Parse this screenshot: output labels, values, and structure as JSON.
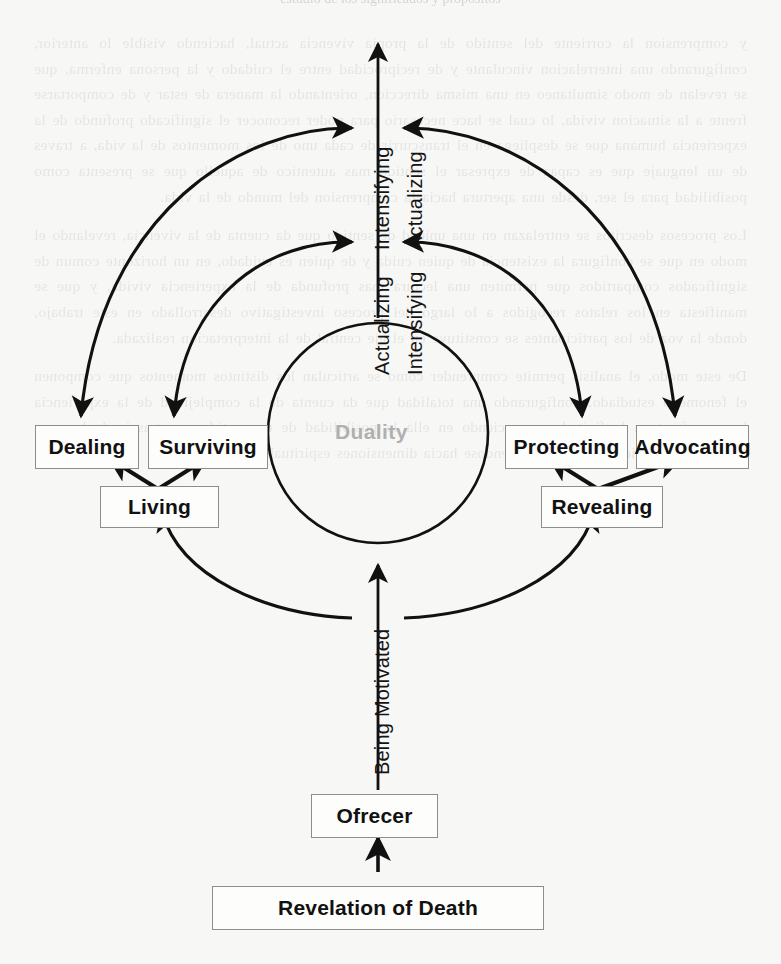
{
  "page": {
    "background_color": "#f7f7f5",
    "ink_color": "#111111",
    "box_border_color": "#8d8d8d",
    "muted_text_color": "#b0b0b0",
    "cropped_header_text": "estudio de los significados y propositos"
  },
  "diagram": {
    "type": "process-cycle-diagram",
    "core": {
      "label": "Duality"
    },
    "axis_labels": {
      "upper_left": "Intensifying",
      "upper_right": "Actualizing",
      "lower_left": "Actualizing",
      "lower_right": "Intensifying",
      "bottom": "Being Motivated"
    },
    "nodes": [
      {
        "id": "dealing",
        "label": "Dealing"
      },
      {
        "id": "surviving",
        "label": "Surviving"
      },
      {
        "id": "living",
        "label": "Living"
      },
      {
        "id": "protecting",
        "label": "Protecting"
      },
      {
        "id": "advocating",
        "label": "Advocating"
      },
      {
        "id": "revealing",
        "label": "Revealing"
      },
      {
        "id": "ofrecer",
        "label": "Ofrecer"
      },
      {
        "id": "revelation",
        "label": "Revelation of Death"
      }
    ]
  },
  "bleed_text": {
    "lines": [
      "y comprension la corriente del sentido de la propia vivencia actual, haciendo",
      "visible lo anterior, configurando una interrelacion vinculante y de reciprocidad",
      "entre el cuidado y la persona enferma, que se revelan de modo simultaneo en",
      "una misma direccion, orientando la manera de estar y de comportarse frente a la",
      "situacion vivida, lo cual se hace necesario para poder reconocer el significado",
      "profundo de la experiencia humana que se despliega en el transcurrir de cada",
      "uno de los momentos de la vida, a traves de un lenguaje que es capaz de",
      "expresar el sentido mas autentico de aquello que se presenta como posibilidad",
      "para el ser, desde una apertura hacia la comprension del mundo de la vida.",
      "",
      "Los procesos descritos se entrelazan en una unidad de sentido que da cuenta de",
      "la vivencia, revelando el modo en que se configura la existencia de quien cuida",
      "y de quien es cuidado, en un horizonte comun de significados compartidos que",
      "permiten una lectura mas profunda de la experiencia vivida, y que se manifiesta",
      "en los relatos recogidos a lo largo del proceso investigativo desarrollado en",
      "este trabajo, donde la voz de los participantes se constituye en el eje central de",
      "la interpretacion realizada.",
      "",
      "De este modo, el analisis permite comprender como se articulan los distintos",
      "momentos que componen el fenomeno estudiado, configurando una totalidad",
      "que da cuenta de la complejidad de la experiencia humana frente a la finitud,",
      "reconociendo en ella la posibilidad de un sentido que trasciende la mera",
      "condicion biologica del existir, abriendose hacia dimensiones espirituales."
    ]
  }
}
